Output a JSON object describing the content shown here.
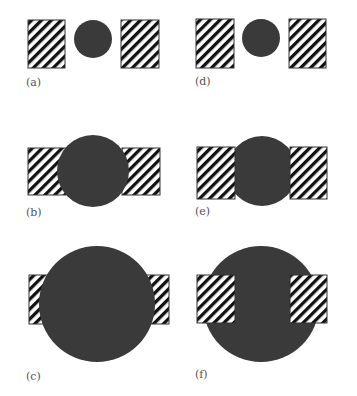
{
  "figure": {
    "colors": {
      "disk": "#3a3a3a",
      "hatch": "#111111",
      "border": "#333333",
      "background": "#ffffff"
    },
    "panels": [
      {
        "id": "a",
        "label": "(a)",
        "label_pos": [
          26,
          76
        ]
      },
      {
        "id": "b",
        "label": "(b)",
        "label_pos": [
          26,
          206
        ]
      },
      {
        "id": "c",
        "label": "(c)",
        "label_pos": [
          26,
          370
        ]
      },
      {
        "id": "d",
        "label": "(d)",
        "label_pos": [
          195,
          75
        ]
      },
      {
        "id": "e",
        "label": "(e)",
        "label_pos": [
          195,
          205
        ]
      },
      {
        "id": "f",
        "label": "(f)",
        "label_pos": [
          195,
          368
        ]
      }
    ]
  }
}
